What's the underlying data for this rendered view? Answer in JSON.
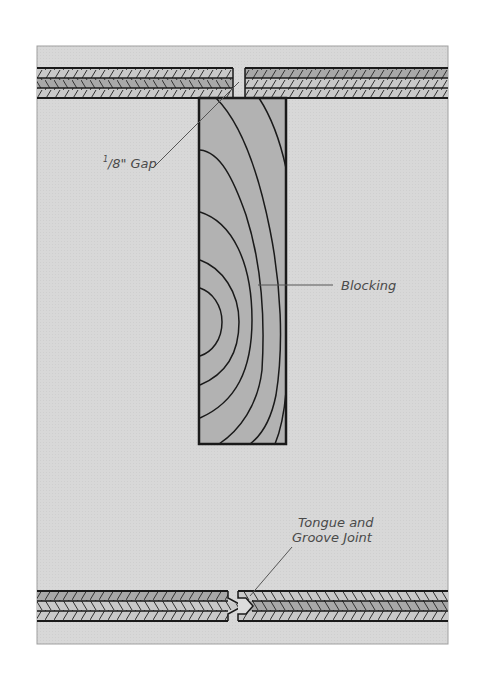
{
  "diagram": {
    "colors": {
      "background_panel": "#d9d9d9",
      "panel_border": "#9a9a9a",
      "board_light": "#c8c8c8",
      "board_mid": "#a9a9a9",
      "blocking_fill": "#b0b0b0",
      "outline": "#1a1a1a",
      "leader_line": "#555555",
      "label_text": "#4a4a4a"
    },
    "labels": {
      "gap": {
        "numerator": "1",
        "denominator": "8",
        "unit": "\"",
        "text": "Gap"
      },
      "blocking": "Blocking",
      "joint_line1": "Tongue and",
      "joint_line2": "Groove Joint"
    },
    "components": [
      {
        "name": "top-left-board",
        "layers": 3
      },
      {
        "name": "top-right-board",
        "layers": 3
      },
      {
        "name": "blocking",
        "grain": "end-grain rings"
      },
      {
        "name": "bottom-left-board",
        "layers": 3,
        "joint": "tongue"
      },
      {
        "name": "bottom-right-board",
        "layers": 3,
        "joint": "groove"
      }
    ]
  }
}
